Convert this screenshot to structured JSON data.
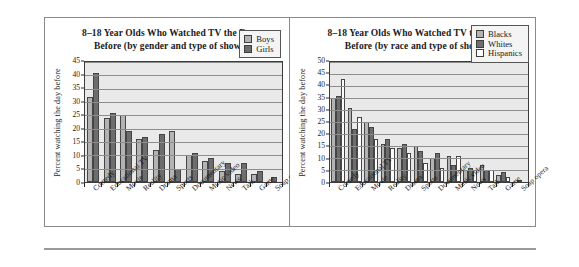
{
  "figure": {
    "panel_count": 2,
    "divider": "horizontal-rule"
  },
  "chart_data": [
    {
      "type": "bar",
      "title": "8–18 Year Olds Who Watched TV the Day Before (by gender and type of show)",
      "title_line1": "8–18 Year Olds Who Watched TV the Day",
      "title_line2": "Before (by gender and type of show)",
      "xlabel": "",
      "ylabel": "Percent watching the day before",
      "ylim": [
        0,
        45
      ],
      "ytick_labels": [
        "0",
        "5",
        "10",
        "15",
        "20",
        "25",
        "30",
        "35",
        "40",
        "45"
      ],
      "ytick_values": [
        0,
        5,
        10,
        15,
        20,
        25,
        30,
        35,
        40,
        45
      ],
      "grid": true,
      "legend_position": "top-right",
      "categories": [
        "Comedy",
        "Educational TV",
        "Movie",
        "Reality",
        "Drama",
        "Sports",
        "Documentary",
        "Music video",
        "News",
        "Talk",
        "Game",
        "Soap opera"
      ],
      "series": [
        {
          "name": "Boys",
          "color": "#b3b3b3",
          "values": [
            32,
            24,
            25,
            16,
            12,
            19,
            10,
            8,
            4,
            3,
            3,
            0
          ]
        },
        {
          "name": "Girls",
          "color": "#6d6d6d",
          "values": [
            41,
            26,
            19,
            17,
            18,
            5,
            11,
            9,
            7,
            7,
            4,
            2
          ]
        }
      ]
    },
    {
      "type": "bar",
      "title": "8–18 Year Olds Who Watched TV the Day Before (by race and type of show)",
      "title_line1": "8–18 Year Olds Who Watched TV the Day",
      "title_line2": "Before (by race and type of show)",
      "xlabel": "",
      "ylabel": "Percent watching the day before",
      "ylim": [
        0,
        50
      ],
      "ytick_labels": [
        "0",
        "5",
        "10",
        "15",
        "20",
        "25",
        "30",
        "35",
        "40",
        "45",
        "50"
      ],
      "ytick_values": [
        0,
        5,
        10,
        15,
        20,
        25,
        30,
        35,
        40,
        45,
        50
      ],
      "grid": true,
      "legend_position": "top-right",
      "categories": [
        "Comedy",
        "Educational TV",
        "Movie",
        "Reality",
        "Drama",
        "Sports",
        "Documentary",
        "Music video",
        "News",
        "Talk",
        "Game",
        "Soap opera"
      ],
      "series": [
        {
          "name": "Blacks",
          "color": "#b3b3b3",
          "values": [
            35,
            31,
            25,
            16,
            14,
            15,
            10,
            11,
            5,
            7,
            3,
            0
          ]
        },
        {
          "name": "Whites",
          "color": "#6d6d6d",
          "values": [
            36,
            22,
            23,
            18,
            16,
            13,
            12,
            7,
            6,
            5,
            4,
            1
          ]
        },
        {
          "name": "Hispanics",
          "color": "#ffffff",
          "values": [
            43,
            27,
            18,
            14,
            12,
            8,
            6,
            11,
            5,
            5,
            2,
            0
          ]
        }
      ]
    }
  ]
}
